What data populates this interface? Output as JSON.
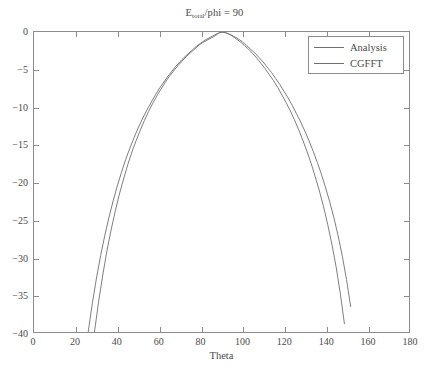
{
  "figure": {
    "background": "#ffffff",
    "frame_color": "#8d8d8d",
    "text_color": "#4a4a4a"
  },
  "bottom_caption": {
    "text": ""
  },
  "chart_data": {
    "type": "line",
    "title_main_before": "E",
    "title_subscript": "total",
    "title_main_after": "/phi = 90",
    "xlabel": "Theta",
    "ylabel": "",
    "xlim": [
      0,
      180
    ],
    "ylim": [
      -40,
      0
    ],
    "xticks": [
      0,
      20,
      40,
      60,
      80,
      100,
      120,
      140,
      160,
      180
    ],
    "xticklabels": [
      "0",
      "20",
      "40",
      "60",
      "80",
      "100",
      "120",
      "140",
      "160",
      "180"
    ],
    "yticks": [
      -40,
      -35,
      -30,
      -25,
      -20,
      -15,
      -10,
      -5,
      0
    ],
    "yticklabels": [
      "-40",
      "-35",
      "-30",
      "-25",
      "-20",
      "-15",
      "-10",
      "-5",
      "0"
    ],
    "grid": false,
    "legend_position": "upper right",
    "series": [
      {
        "name": "Analysis",
        "color": "#6f6f6f",
        "linewidth": 0.9,
        "x": [
          26.0,
          28.0,
          30.0,
          32.0,
          34.0,
          36.0,
          38.0,
          40.0,
          42.0,
          44.0,
          46.0,
          48.0,
          50.0,
          52.0,
          54.0,
          56.0,
          58.0,
          60.0,
          62.0,
          64.0,
          66.0,
          68.0,
          70.0,
          72.0,
          74.0,
          76.0,
          78.0,
          80.0,
          82.0,
          84.0,
          86.0,
          88.0,
          89.0,
          90.0,
          92.0,
          94.0,
          96.0,
          98.0,
          100.0,
          102.0,
          104.0,
          106.0,
          108.0,
          110.0,
          112.0,
          114.0,
          116.0,
          118.0,
          120.0,
          122.0,
          124.0,
          126.0,
          128.0,
          130.0,
          132.0,
          134.0,
          136.0,
          138.0,
          140.0,
          142.0,
          144.0,
          146.0,
          148.0,
          150.0,
          152.0
        ],
        "y": [
          -40.0,
          -36.2,
          -32.8,
          -29.8,
          -27.1,
          -24.7,
          -22.5,
          -20.5,
          -18.7,
          -17.0,
          -15.5,
          -14.1,
          -12.8,
          -11.6,
          -10.5,
          -9.5,
          -8.5,
          -7.6,
          -6.8,
          -6.0,
          -5.3,
          -4.6,
          -4.0,
          -3.4,
          -2.9,
          -2.4,
          -1.9,
          -1.5,
          -1.1,
          -0.8,
          -0.5,
          -0.2,
          -0.1,
          0.0,
          -0.1,
          -0.3,
          -0.6,
          -0.9,
          -1.3,
          -1.8,
          -2.3,
          -2.8,
          -3.4,
          -4.0,
          -4.7,
          -5.4,
          -6.2,
          -7.0,
          -7.9,
          -8.8,
          -9.8,
          -10.9,
          -12.0,
          -13.2,
          -14.5,
          -15.9,
          -17.4,
          -19.0,
          -20.8,
          -22.7,
          -24.8,
          -27.2,
          -29.9,
          -33.0,
          -36.6
        ],
        "crosses_minus40_at": [
          26.0,
          153.5
        ]
      },
      {
        "name": "CGFFT",
        "color": "#6f6f6f",
        "linewidth": 0.9,
        "x": [
          29.0,
          31.0,
          33.0,
          35.0,
          37.0,
          39.0,
          41.0,
          43.0,
          45.0,
          47.0,
          49.0,
          51.0,
          53.0,
          55.0,
          57.0,
          59.0,
          61.0,
          63.0,
          65.0,
          67.0,
          69.0,
          71.0,
          73.0,
          75.0,
          77.0,
          79.0,
          81.0,
          83.0,
          85.0,
          87.0,
          88.0,
          89.0,
          91.0,
          93.0,
          95.0,
          97.0,
          99.0,
          101.0,
          103.0,
          105.0,
          107.0,
          109.0,
          111.0,
          113.0,
          115.0,
          117.0,
          119.0,
          121.0,
          123.0,
          125.0,
          127.0,
          129.0,
          131.0,
          133.0,
          135.0,
          137.0,
          139.0,
          141.0,
          143.0,
          145.0,
          147.0,
          149.0
        ],
        "y": [
          -40.0,
          -36.0,
          -32.4,
          -29.2,
          -26.4,
          -23.9,
          -21.6,
          -19.6,
          -17.7,
          -16.0,
          -14.5,
          -13.1,
          -11.8,
          -10.6,
          -9.5,
          -8.5,
          -7.6,
          -6.7,
          -5.9,
          -5.2,
          -4.5,
          -3.9,
          -3.3,
          -2.8,
          -2.3,
          -1.8,
          -1.4,
          -1.1,
          -0.8,
          -0.5,
          -0.3,
          -0.1,
          0.0,
          -0.2,
          -0.5,
          -0.9,
          -1.3,
          -1.8,
          -2.3,
          -2.9,
          -3.5,
          -4.2,
          -4.9,
          -5.7,
          -6.5,
          -7.4,
          -8.4,
          -9.4,
          -10.5,
          -11.7,
          -13.0,
          -14.4,
          -15.9,
          -17.5,
          -19.3,
          -21.2,
          -23.3,
          -25.7,
          -28.3,
          -31.3,
          -34.8,
          -38.9
        ],
        "crosses_minus40_at": [
          29.0,
          149.6
        ]
      }
    ],
    "annotations": []
  }
}
